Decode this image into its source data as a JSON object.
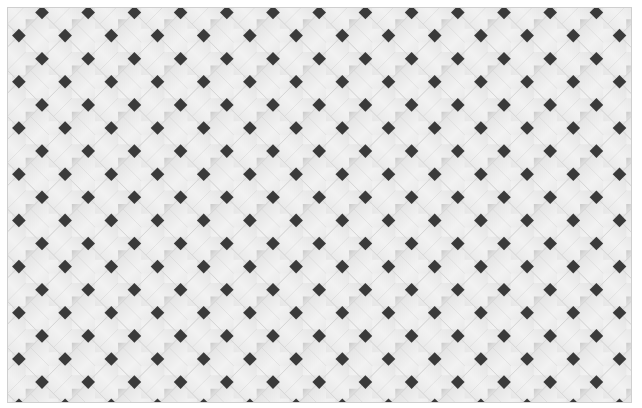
{
  "pattern": {
    "name": "woven lattice panel",
    "panel": {
      "left": 7,
      "top": 7,
      "width": 625,
      "height": 396
    },
    "period": 46.2,
    "origin": {
      "x": 42,
      "y": 12.5
    },
    "colors": {
      "background": "#ffffff",
      "strip_light": "#f2f2f2",
      "strip_mid": "#e6e6e6",
      "strip_shadow": "#c8c8c8",
      "hole": "#3a3a3a",
      "border": "#cfcfcf"
    }
  }
}
